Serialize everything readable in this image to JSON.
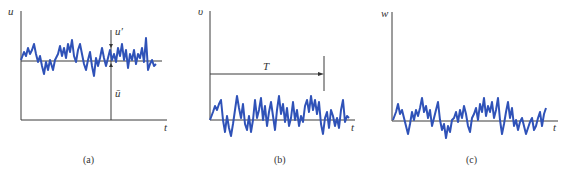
{
  "figure": {
    "panels": [
      {
        "id": "a",
        "caption": "(a)",
        "y_label": "u",
        "x_label": "t",
        "annotations": {
          "fluctuation": "u′",
          "mean": "ū"
        },
        "description": "Turbulent velocity u fluctuating about nonzero mean ū"
      },
      {
        "id": "b",
        "caption": "(b)",
        "y_label": "υ",
        "x_label": "t",
        "annotations": {
          "period": "T"
        },
        "description": "Velocity component v fluctuating about zero, averaging interval T"
      },
      {
        "id": "c",
        "caption": "(c)",
        "y_label": "w",
        "x_label": "t",
        "description": "Velocity component w fluctuating about zero"
      }
    ],
    "colors": {
      "signal": "#2f52b8",
      "axis": "#3a3a3a"
    }
  }
}
